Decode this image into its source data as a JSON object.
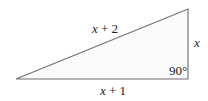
{
  "diagram": {
    "type": "right-triangle",
    "colors": {
      "stroke": "#6e6e6e",
      "fill": "#fbfbfb",
      "text": "#222222"
    },
    "vertices": {
      "left": [
        16,
        79
      ],
      "top_right": [
        188,
        9
      ],
      "bottom_right": [
        188,
        79
      ]
    },
    "labels": {
      "hypotenuse": {
        "var": "x",
        "rest": " + 2"
      },
      "vertical_side": {
        "var": "x"
      },
      "base": {
        "var": "x",
        "rest": " + 1"
      },
      "right_angle": "90°"
    }
  }
}
